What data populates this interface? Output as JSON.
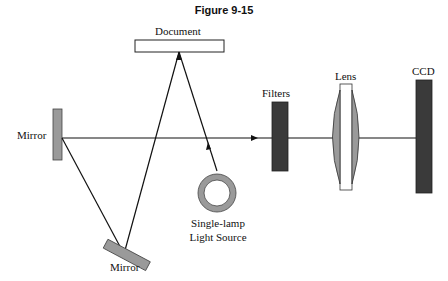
{
  "figure": {
    "title": "Figure 9-15"
  },
  "labels": {
    "document": "Document",
    "mirror_top": "Mirror",
    "mirror_bottom": "Mirror",
    "light_source_line1": "Single-lamp",
    "light_source_line2": "Light Source",
    "filters": "Filters",
    "lens": "Lens",
    "ccd": "CCD"
  },
  "colors": {
    "component_dark": "#3a3a3a",
    "component_gray": "#9a9a9a",
    "line": "#111111",
    "background": "#ffffff"
  }
}
